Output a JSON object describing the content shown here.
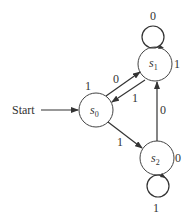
{
  "diagram": {
    "type": "finite-state-machine",
    "start_label": "Start",
    "states": [
      {
        "id": "s0",
        "name": "s",
        "sub": "0",
        "cx": 96,
        "cy": 110,
        "r": 17
      },
      {
        "id": "s1",
        "name": "s",
        "sub": "1",
        "cx": 155,
        "cy": 64,
        "r": 17
      },
      {
        "id": "s2",
        "name": "s",
        "sub": "2",
        "cx": 157,
        "cy": 158,
        "r": 17
      }
    ],
    "transitions": [
      {
        "from": "s0",
        "to": "s1",
        "input": "0",
        "output": "1"
      },
      {
        "from": "s1",
        "to": "s0",
        "input": "1"
      },
      {
        "from": "s1",
        "to": "s1",
        "input": "0",
        "output": "1"
      },
      {
        "from": "s0",
        "to": "s2",
        "input": "1"
      },
      {
        "from": "s2",
        "to": "s1",
        "input": "0"
      },
      {
        "from": "s2",
        "to": "s2",
        "input": "1",
        "output": "0"
      }
    ],
    "labels": {
      "s0_out": "1",
      "s0_s1": "0",
      "s1_s0": "1",
      "s1_loop": "0",
      "s1_out": "1",
      "s0_s2": "1",
      "s2_s1": "0",
      "s2_out": "0",
      "s2_loop": "1"
    }
  }
}
